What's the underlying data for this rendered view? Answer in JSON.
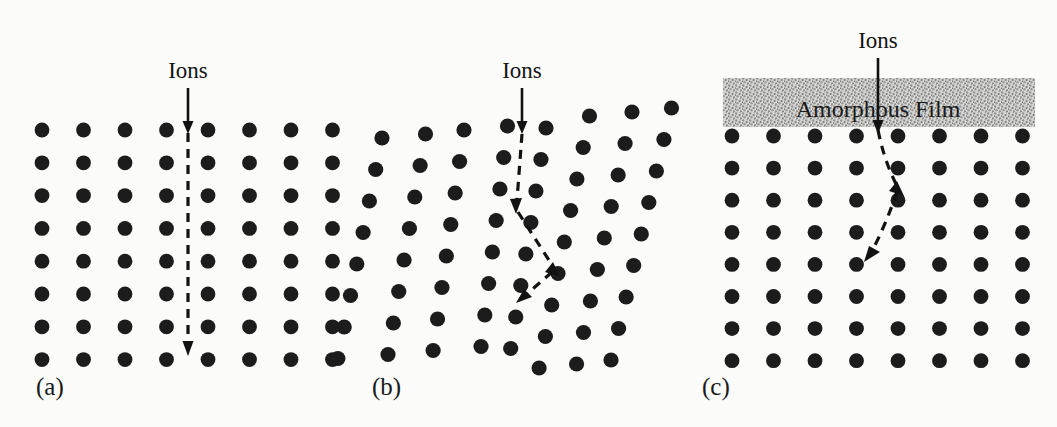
{
  "figure": {
    "background_color": "#fbfbfa",
    "atom_color": "#1c1c1c",
    "ink_color": "#121212",
    "film_fill_color": "#c9c9c9",
    "width": 1057,
    "height": 427
  },
  "panels": [
    {
      "id": "a",
      "label": "(a)",
      "label_x": 36,
      "label_y": 395,
      "ions_label": "Ions",
      "ions_label_x": 188,
      "ions_label_y": 78,
      "lattice": {
        "type": "perfect-crystal",
        "columns": 8,
        "rows": 8,
        "x0": 42,
        "y0": 130,
        "dx": 41.5,
        "dy": 32.8,
        "radius": 7.4,
        "column_tilts": [
          0,
          0,
          0,
          0,
          0,
          0,
          0,
          0
        ]
      },
      "trajectory": {
        "description": "channeled-straight",
        "solid_segment": {
          "x1": 188,
          "y1": 88,
          "x2": 188,
          "y2": 124
        },
        "dashed_points": [
          [
            188,
            128
          ],
          [
            188,
            348
          ]
        ],
        "arrowheads": [
          {
            "x": 188,
            "y": 131,
            "angle": 90
          },
          {
            "x": 188,
            "y": 352,
            "angle": 90
          }
        ]
      }
    },
    {
      "id": "b",
      "label": "(b)",
      "label_x": 372,
      "label_y": 395,
      "ions_label": "Ions",
      "ions_label_x": 522,
      "ions_label_y": 78,
      "lattice": {
        "type": "distorted-crystal",
        "columns": 8,
        "rows": 9,
        "x0": 382,
        "y0": 132,
        "dx": 41.5,
        "dy": 31.5,
        "radius": 7.6,
        "column_tilts": [
          -0.2,
          -0.17,
          -0.14,
          -0.12,
          -0.16,
          -0.2,
          -0.22,
          -0.24
        ],
        "column_y_offsets": [
          6,
          2,
          -2,
          -6,
          -4,
          -16,
          -20,
          -24
        ],
        "column_x_jitter": [
          0,
          2,
          -1,
          1,
          -2,
          0,
          1,
          -1
        ]
      },
      "trajectory": {
        "description": "dechanneled-scattered",
        "solid_segment": {
          "x1": 522,
          "y1": 88,
          "x2": 522,
          "y2": 127
        },
        "dashed_points": [
          [
            522,
            130
          ],
          [
            516,
            205
          ],
          [
            551,
            268
          ],
          [
            525,
            295
          ]
        ],
        "arrowheads": [
          {
            "x": 522,
            "y": 132,
            "angle": 90
          },
          {
            "x": 518,
            "y": 209,
            "angle": 95
          },
          {
            "x": 555,
            "y": 272,
            "angle": 60
          },
          {
            "x": 524,
            "y": 299,
            "angle": 132
          }
        ]
      }
    },
    {
      "id": "c",
      "label": "(c)",
      "label_x": 702,
      "label_y": 395,
      "ions_label": "Ions",
      "ions_label_x": 878,
      "ions_label_y": 48,
      "lattice": {
        "type": "perfect-crystal-under-film",
        "columns": 8,
        "rows": 8,
        "x0": 732,
        "y0": 136,
        "dx": 41.5,
        "dy": 32.1,
        "radius": 7.4,
        "column_tilts": [
          0,
          0,
          0,
          0,
          0,
          0,
          0,
          0
        ]
      },
      "film": {
        "label": "Amorphous Film",
        "label_x": 878,
        "label_y": 117,
        "x": 723,
        "y": 78,
        "width": 312,
        "height": 49,
        "texture": "stipple"
      },
      "trajectory": {
        "description": "dechanneled-by-surface-film",
        "solid_segment": {
          "x1": 878,
          "y1": 58,
          "x2": 878,
          "y2": 126
        },
        "dashed_points": [
          [
            878,
            128
          ],
          [
            884,
            165
          ],
          [
            897,
            188
          ],
          [
            872,
            250
          ]
        ],
        "arrowheads": [
          {
            "x": 878,
            "y": 129,
            "angle": 90
          },
          {
            "x": 899,
            "y": 191,
            "angle": 62
          },
          {
            "x": 870,
            "y": 255,
            "angle": 114
          }
        ]
      }
    }
  ]
}
